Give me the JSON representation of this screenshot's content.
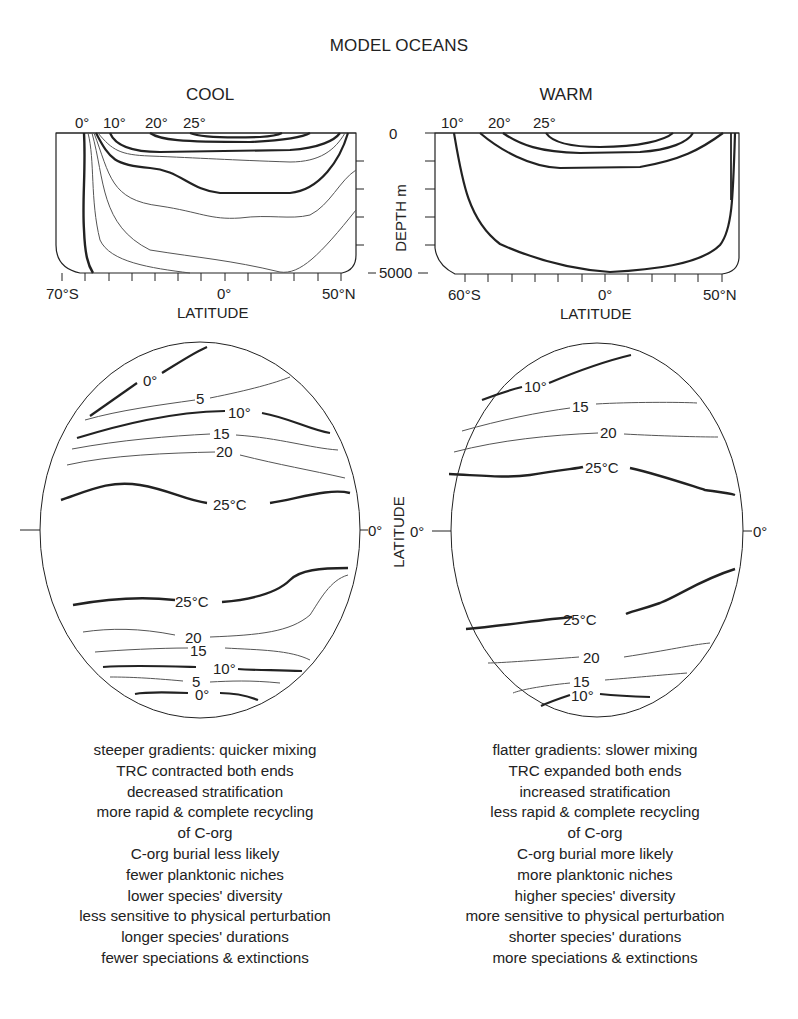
{
  "title": "MODEL OCEANS",
  "panels": {
    "cool": {
      "heading": "COOL",
      "section_top_labels": [
        "0°",
        "10°",
        "20°",
        "25°"
      ],
      "x_ticks": {
        "left": "70°S",
        "center": "0°",
        "right": "50°N"
      },
      "x_label": "LATITUDE",
      "map_labels": {
        "north": [
          "0°",
          "5",
          "10°",
          "15",
          "20",
          "25°C"
        ],
        "south": [
          "25°C",
          "20",
          "15",
          "10°",
          "5",
          "0°"
        ],
        "equator": "0°"
      },
      "notes": [
        "steeper gradients: quicker mixing",
        "TRC contracted both ends",
        "decreased stratification",
        "more rapid & complete recycling",
        "of C-org",
        "C-org burial less likely",
        "fewer planktonic niches",
        "lower species' diversity",
        "less sensitive to physical perturbation",
        "longer species' durations",
        "fewer speciations & extinctions"
      ]
    },
    "warm": {
      "heading": "WARM",
      "section_top_labels": [
        "10°",
        "20°",
        "25°"
      ],
      "x_ticks": {
        "left": "60°S",
        "center": "0°",
        "right": "50°N"
      },
      "x_label": "LATITUDE",
      "map_labels": {
        "north": [
          "10°",
          "15",
          "20",
          "25°C"
        ],
        "south": [
          "25°C",
          "20",
          "15",
          "10°"
        ],
        "equator_left": "0°",
        "equator_right": "0°"
      },
      "notes": [
        "flatter gradients: slower mixing",
        "TRC expanded both ends",
        "increased stratification",
        "less rapid & complete recycling",
        "of C-org",
        "C-org burial more likely",
        "more planktonic niches",
        "higher species' diversity",
        "more sensitive to physical perturbation",
        "shorter species' durations",
        "more speciations & extinctions"
      ]
    }
  },
  "depth_axis": {
    "top": "0",
    "bottom": "5000",
    "label": "DEPTH m"
  },
  "map_axis_label": "LATITUDE",
  "colors": {
    "line": "#222222",
    "thin_line": "#555555",
    "background": "#ffffff"
  }
}
